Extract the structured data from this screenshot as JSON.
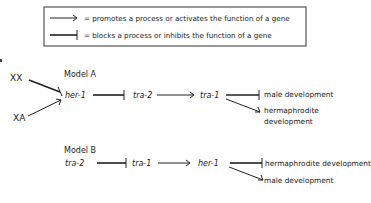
{
  "legend": {
    "promotes": "= promotes a process or activates the function of a gene",
    "blocks": "= blocks a process or inhibits the function of a gene"
  },
  "model_a": {
    "title": "Model A",
    "inputs": [
      "XX",
      "XA"
    ],
    "genes": [
      "her-1",
      "tra-2",
      "tra-1"
    ],
    "outcomes": [
      "male development",
      "hermaphrodite",
      "development"
    ]
  },
  "model_b": {
    "title": "Model B",
    "genes": [
      "tra-2",
      "tra-1",
      "her-1"
    ],
    "outcomes": [
      "hermaphrodite development",
      "male development"
    ]
  },
  "edge_marker": "1"
}
